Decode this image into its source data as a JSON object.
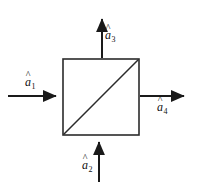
{
  "figure": {
    "type": "schematic-diagram",
    "background_color": "#ffffff",
    "stroke_color": "#1a1a1a"
  },
  "block": {
    "name": "four-port-block",
    "shape": "square",
    "x": 63,
    "y": 59,
    "width": 76,
    "height": 76,
    "stroke_width": 1.6,
    "fill": "#ffffff",
    "diagonal": {
      "name": "diagonal-line",
      "from": "bottom-left",
      "to": "top-right",
      "x1": 63,
      "y1": 135,
      "x2": 139,
      "y2": 59,
      "stroke_width": 1.6
    }
  },
  "ports": [
    {
      "id": "a1",
      "label": "a",
      "subscript": "1",
      "accent": "hat",
      "side": "left",
      "direction": "into-block",
      "arrow": {
        "x1": 8,
        "y1": 96,
        "x2": 62,
        "y2": 96
      }
    },
    {
      "id": "a2",
      "label": "a",
      "subscript": "2",
      "accent": "hat",
      "side": "bottom",
      "direction": "into-block",
      "arrow": {
        "x1": 99,
        "y1": 182,
        "x2": 99,
        "y2": 136
      }
    },
    {
      "id": "a3",
      "label": "a",
      "subscript": "3",
      "accent": "hat",
      "side": "top",
      "direction": "out-of-block",
      "arrow": {
        "x1": 102,
        "y1": 58,
        "x2": 102,
        "y2": 13
      }
    },
    {
      "id": "a4",
      "label": "a",
      "subscript": "4",
      "accent": "hat",
      "side": "right",
      "direction": "out-of-block",
      "arrow": {
        "x1": 140,
        "y1": 96,
        "x2": 190,
        "y2": 96
      }
    }
  ],
  "arrow_style": {
    "stroke_width": 2,
    "head_length": 11,
    "head_width": 9,
    "head_fill": "#1a1a1a"
  },
  "accent_glyph": "^"
}
